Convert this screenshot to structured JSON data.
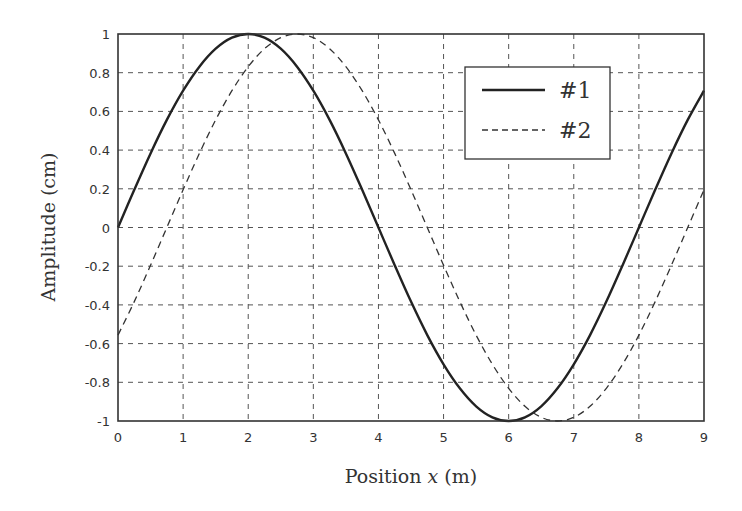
{
  "chart_data": {
    "type": "line",
    "title": "",
    "xlabel": "Position x (m)",
    "xlabel_parts": {
      "prefix": "Position ",
      "var": "x",
      "suffix": " (m)"
    },
    "ylabel": "Amplitude (cm)",
    "xlim": [
      0,
      9
    ],
    "ylim": [
      -1,
      1
    ],
    "grid": true,
    "legend_position": "upper right",
    "x_ticks": [
      "0",
      "1",
      "2",
      "3",
      "4",
      "5",
      "6",
      "7",
      "8",
      "9"
    ],
    "y_ticks": [
      "1",
      "0.8",
      "0.6",
      "0.4",
      "0.2",
      "0",
      "-0.2",
      "-0.4",
      "-0.6",
      "-0.8",
      "-1"
    ],
    "x": [
      0,
      0.25,
      0.5,
      0.75,
      1,
      1.25,
      1.5,
      1.75,
      2,
      2.25,
      2.5,
      2.75,
      3,
      3.25,
      3.5,
      3.75,
      4,
      4.25,
      4.5,
      4.75,
      5,
      5.25,
      5.5,
      5.75,
      6,
      6.25,
      6.5,
      6.75,
      7,
      7.25,
      7.5,
      7.75,
      8,
      8.25,
      8.5,
      8.75,
      9
    ],
    "series": [
      {
        "name": "#1",
        "style": "solid",
        "color": "#222222",
        "values": [
          0,
          0.195,
          0.383,
          0.556,
          0.707,
          0.831,
          0.924,
          0.981,
          1,
          0.981,
          0.924,
          0.831,
          0.707,
          0.556,
          0.383,
          0.195,
          0,
          -0.195,
          -0.383,
          -0.556,
          -0.707,
          -0.831,
          -0.924,
          -0.981,
          -1,
          -0.981,
          -0.924,
          -0.831,
          -0.707,
          -0.556,
          -0.383,
          -0.195,
          0,
          0.195,
          0.383,
          0.556,
          0.707
        ]
      },
      {
        "name": "#2",
        "style": "dashed",
        "color": "#333333",
        "values": [
          -0.556,
          -0.383,
          -0.195,
          0,
          0.195,
          0.383,
          0.556,
          0.707,
          0.831,
          0.924,
          0.981,
          1,
          0.981,
          0.924,
          0.831,
          0.707,
          0.556,
          0.383,
          0.195,
          0,
          -0.195,
          -0.383,
          -0.556,
          -0.707,
          -0.831,
          -0.924,
          -0.981,
          -1,
          -0.981,
          -0.924,
          -0.831,
          -0.707,
          -0.556,
          -0.383,
          -0.195,
          0,
          0.195
        ]
      }
    ]
  },
  "legend": {
    "items": [
      {
        "label": "#1",
        "style": "solid"
      },
      {
        "label": "#2",
        "style": "dashed"
      }
    ]
  }
}
